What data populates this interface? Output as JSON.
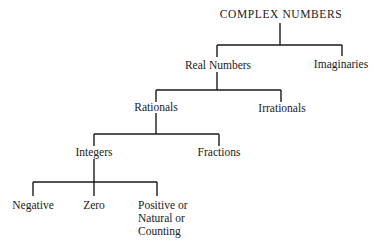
{
  "diagram": {
    "type": "tree",
    "root": "COMPLEX NUMBERS",
    "nodes": {
      "complex": "COMPLEX NUMBERS",
      "real": "Real Numbers",
      "imaginaries": "Imaginaries",
      "rationals": "Rationals",
      "irrationals": "Irrationals",
      "integers": "Integers",
      "fractions": "Fractions",
      "negative": "Negative",
      "zero": "Zero",
      "positive": "Positive or\nNatural or\nCounting"
    },
    "edges": [
      [
        "COMPLEX NUMBERS",
        "Real Numbers"
      ],
      [
        "COMPLEX NUMBERS",
        "Imaginaries"
      ],
      [
        "Real Numbers",
        "Rationals"
      ],
      [
        "Real Numbers",
        "Irrationals"
      ],
      [
        "Rationals",
        "Integers"
      ],
      [
        "Rationals",
        "Fractions"
      ],
      [
        "Integers",
        "Negative"
      ],
      [
        "Integers",
        "Zero"
      ],
      [
        "Integers",
        "Positive or Natural or Counting"
      ]
    ]
  }
}
